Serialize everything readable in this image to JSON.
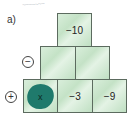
{
  "header": {
    "scribble_text": "~~~~~~~",
    "label": "a)"
  },
  "pyramid": {
    "operators": {
      "minus": "−",
      "plus": "+"
    },
    "rows": [
      {
        "row": 1,
        "cells": [
          "−10"
        ]
      },
      {
        "row": 2,
        "cells": [
          "",
          ""
        ]
      },
      {
        "row": 3,
        "cells": [
          "x",
          "−3",
          "−9"
        ]
      }
    ],
    "unknown_cell": {
      "value": "x",
      "color": "#1f7a6c"
    },
    "box_color": "#c8e4ca",
    "border_color": "#5c6b5f"
  }
}
